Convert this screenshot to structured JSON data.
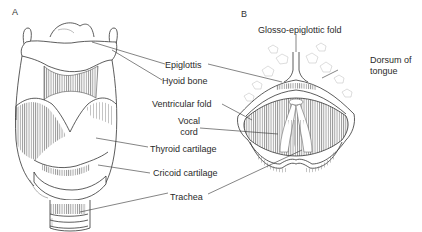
{
  "figure": {
    "panels": [
      {
        "id": "A",
        "letter": "A",
        "description": "Anterior view of larynx",
        "labels": [
          {
            "text": "Epiglottis"
          },
          {
            "text": "Hyoid bone"
          },
          {
            "text": "Thyroid cartilage"
          },
          {
            "text": "Cricoid cartilage"
          },
          {
            "text": "Trachea"
          }
        ]
      },
      {
        "id": "B",
        "letter": "B",
        "description": "Laryngoscopic view from above",
        "labels": [
          {
            "text": "Glosso-epiglottic fold"
          },
          {
            "text": "Dorsum of"
          },
          {
            "text": "tongue"
          },
          {
            "text": "Ventricular  fold"
          },
          {
            "text": "Vocal"
          },
          {
            "text": "cord"
          }
        ]
      }
    ],
    "colors": {
      "line": "#333333",
      "shade": "#555555",
      "background": "#ffffff"
    }
  }
}
